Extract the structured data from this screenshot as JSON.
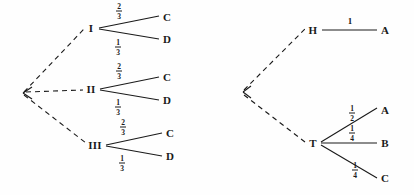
{
  "figure": {
    "background_color": "#fefefe",
    "stroke_color": "#1a1a1a",
    "width": 414,
    "height": 195
  },
  "trees": [
    {
      "id": "left-tree",
      "root": {
        "x": 23,
        "y": 93,
        "label": ""
      },
      "nodes": [
        {
          "id": "I",
          "label": "I",
          "x": 91,
          "y": 28
        },
        {
          "id": "II",
          "label": "II",
          "x": 91,
          "y": 89
        },
        {
          "id": "III",
          "label": "III",
          "x": 95,
          "y": 145
        }
      ],
      "leaves": [
        {
          "id": "I-C",
          "label": "C",
          "x": 167,
          "y": 17
        },
        {
          "id": "I-D",
          "label": "D",
          "x": 167,
          "y": 39
        },
        {
          "id": "II-C",
          "label": "C",
          "x": 167,
          "y": 77
        },
        {
          "id": "II-D",
          "label": "D",
          "x": 167,
          "y": 100
        },
        {
          "id": "III-C",
          "label": "C",
          "x": 170,
          "y": 133
        },
        {
          "id": "III-D",
          "label": "D",
          "x": 170,
          "y": 156
        }
      ],
      "edges": [
        {
          "from": "root",
          "to": "I",
          "style": "dashed",
          "label": ""
        },
        {
          "from": "root",
          "to": "II",
          "style": "dashed",
          "label": ""
        },
        {
          "from": "root",
          "to": "III",
          "style": "dashed",
          "label": ""
        },
        {
          "from": "I",
          "to": "I-C",
          "style": "solid",
          "label": "2/3"
        },
        {
          "from": "I",
          "to": "I-D",
          "style": "solid",
          "label": "1/3"
        },
        {
          "from": "II",
          "to": "II-C",
          "style": "solid",
          "label": "2/3"
        },
        {
          "from": "II",
          "to": "II-D",
          "style": "solid",
          "label": "1/3"
        },
        {
          "from": "III",
          "to": "III-C",
          "style": "solid",
          "label": "2/3"
        },
        {
          "from": "III",
          "to": "III-D",
          "style": "solid",
          "label": "1/3"
        }
      ],
      "fractions": [
        {
          "id": "f-I-C",
          "num": "2",
          "den": "3",
          "x": 119,
          "y": 11
        },
        {
          "id": "f-I-D",
          "num": "1",
          "den": "3",
          "x": 118,
          "y": 47
        },
        {
          "id": "f-II-C",
          "num": "2",
          "den": "3",
          "x": 119,
          "y": 71
        },
        {
          "id": "f-II-D",
          "num": "1",
          "den": "3",
          "x": 118,
          "y": 107
        },
        {
          "id": "f-III-C",
          "num": "2",
          "den": "3",
          "x": 123,
          "y": 127
        },
        {
          "id": "f-III-D",
          "num": "1",
          "den": "3",
          "x": 122,
          "y": 163
        }
      ]
    },
    {
      "id": "right-tree",
      "root": {
        "x": 243,
        "y": 92,
        "label": ""
      },
      "nodes": [
        {
          "id": "H",
          "label": "H",
          "x": 313,
          "y": 30
        },
        {
          "id": "T",
          "label": "T",
          "x": 313,
          "y": 143
        }
      ],
      "leaves": [
        {
          "id": "H-A",
          "label": "A",
          "x": 385,
          "y": 30
        },
        {
          "id": "T-A",
          "label": "A",
          "x": 385,
          "y": 110
        },
        {
          "id": "T-B",
          "label": "B",
          "x": 385,
          "y": 143
        },
        {
          "id": "T-C",
          "label": "C",
          "x": 385,
          "y": 178
        }
      ],
      "edges": [
        {
          "from": "root",
          "to": "H",
          "style": "dashed",
          "label": ""
        },
        {
          "from": "root",
          "to": "T",
          "style": "dashed",
          "label": ""
        },
        {
          "from": "H",
          "to": "H-A",
          "style": "solid",
          "label": "1"
        },
        {
          "from": "T",
          "to": "T-A",
          "style": "solid",
          "label": "1/2"
        },
        {
          "from": "T",
          "to": "T-B",
          "style": "solid",
          "label": "1/4"
        },
        {
          "from": "T",
          "to": "T-C",
          "style": "solid",
          "label": "1/4"
        }
      ],
      "fractions": [
        {
          "id": "f-H-A",
          "num": "1",
          "den": "",
          "x": 350,
          "y": 22,
          "whole": true
        },
        {
          "id": "f-T-A",
          "num": "1",
          "den": "2",
          "x": 352,
          "y": 113
        },
        {
          "id": "f-T-B",
          "num": "1",
          "den": "4",
          "x": 352,
          "y": 133
        },
        {
          "id": "f-T-C",
          "num": "1",
          "den": "4",
          "x": 355,
          "y": 170
        }
      ]
    }
  ]
}
